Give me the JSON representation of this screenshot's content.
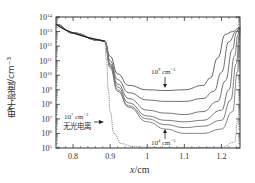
{
  "chart_data": {
    "type": "line",
    "title": "",
    "xlabel": "x/cm",
    "ylabel": "电子密度/cm⁻³",
    "xlim": [
      0.754,
      1.25
    ],
    "ylim_log10": [
      5,
      14
    ],
    "yscale": "log",
    "x_ticks": [
      "0.8",
      "0.9",
      "1",
      "1.1",
      "1.2"
    ],
    "y_ticks": [
      "10^14",
      "10^13",
      "10^12",
      "10^11",
      "10^10",
      "10^9",
      "10^8",
      "10^7",
      "10^6",
      "10^5"
    ],
    "grid": false,
    "legend": null,
    "annotations": [
      {
        "text": "10⁹ cm⁻³",
        "target": "upper curve minimum",
        "x": 1.04,
        "log10_y": 8.9
      },
      {
        "text": "10⁴ cm⁻³",
        "target": "lowest photoionized curve",
        "x": 1.04,
        "log10_y": 6.2
      },
      {
        "text": "10⁷ cm⁻³",
        "line2": "无光电离",
        "target": "no-photoionization curve",
        "x": 0.89,
        "log10_y": 6.6
      }
    ],
    "series": [
      {
        "name": "1e9 cm^-3",
        "x": [
          0.754,
          0.8,
          0.87,
          0.885,
          0.9,
          0.92,
          0.95,
          1.0,
          1.05,
          1.1,
          1.15,
          1.17,
          1.19,
          1.21,
          1.23,
          1.25
        ],
        "log10_y": [
          13.5,
          12.9,
          12.4,
          12.35,
          11.3,
          10.1,
          9.3,
          9.0,
          8.95,
          9.0,
          9.3,
          9.8,
          11.2,
          12.8,
          13.0,
          13.3
        ]
      },
      {
        "name": "1e8 cm^-3",
        "x": [
          0.754,
          0.8,
          0.87,
          0.885,
          0.9,
          0.92,
          0.95,
          1.0,
          1.05,
          1.1,
          1.15,
          1.18,
          1.2,
          1.22,
          1.24,
          1.25
        ],
        "log10_y": [
          13.5,
          12.9,
          12.4,
          12.35,
          11.0,
          9.7,
          8.8,
          8.3,
          8.2,
          8.2,
          8.4,
          8.9,
          10.2,
          12.3,
          13.0,
          13.3
        ]
      },
      {
        "name": "1e7 cm^-3",
        "x": [
          0.754,
          0.8,
          0.87,
          0.885,
          0.9,
          0.92,
          0.95,
          1.0,
          1.05,
          1.1,
          1.15,
          1.19,
          1.21,
          1.23,
          1.24,
          1.25
        ],
        "log10_y": [
          13.5,
          12.9,
          12.4,
          12.35,
          10.8,
          9.4,
          8.4,
          7.6,
          7.4,
          7.3,
          7.5,
          8.2,
          9.6,
          11.8,
          12.9,
          13.3
        ]
      },
      {
        "name": "1e6 cm^-3",
        "x": [
          0.754,
          0.8,
          0.87,
          0.885,
          0.9,
          0.92,
          0.95,
          1.0,
          1.05,
          1.1,
          1.15,
          1.2,
          1.22,
          1.235,
          1.245,
          1.25
        ],
        "log10_y": [
          13.5,
          12.9,
          12.4,
          12.35,
          10.7,
          9.2,
          8.1,
          7.2,
          6.9,
          6.8,
          6.9,
          7.6,
          9.0,
          11.3,
          12.8,
          13.3
        ]
      },
      {
        "name": "1e5 cm^-3",
        "x": [
          0.754,
          0.8,
          0.87,
          0.885,
          0.9,
          0.92,
          0.95,
          1.0,
          1.05,
          1.1,
          1.15,
          1.2,
          1.225,
          1.24,
          1.248,
          1.25
        ],
        "log10_y": [
          13.5,
          12.9,
          12.4,
          12.35,
          10.6,
          9.0,
          7.9,
          7.0,
          6.6,
          6.4,
          6.5,
          6.9,
          8.3,
          10.8,
          12.7,
          13.3
        ]
      },
      {
        "name": "1e4 cm^-3",
        "x": [
          0.754,
          0.8,
          0.87,
          0.885,
          0.9,
          0.92,
          0.95,
          1.0,
          1.05,
          1.1,
          1.15,
          1.2,
          1.23,
          1.243,
          1.249,
          1.25
        ],
        "log10_y": [
          13.5,
          12.9,
          12.4,
          12.35,
          10.5,
          8.9,
          7.8,
          6.8,
          6.3,
          6.0,
          6.0,
          6.3,
          7.5,
          10.2,
          12.6,
          13.3
        ]
      },
      {
        "name": "无光电离",
        "x": [
          0.754,
          0.8,
          0.87,
          0.885,
          0.89,
          0.895,
          0.9,
          0.91,
          0.93,
          0.96,
          1.0,
          1.1,
          1.2,
          1.235,
          1.245,
          1.25
        ],
        "log10_y": [
          13.5,
          12.9,
          12.4,
          12.35,
          11.0,
          9.0,
          7.5,
          6.0,
          5.3,
          5.1,
          5.05,
          5.02,
          5.05,
          5.4,
          7.0,
          9.0
        ]
      }
    ]
  },
  "labels": {
    "xlabel_var": "x",
    "xlabel_unit": "/cm",
    "ylabel": "电子密度/cm⁻³"
  }
}
